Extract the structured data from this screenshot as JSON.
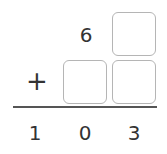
{
  "problem": {
    "operator": "+",
    "top_row": {
      "tens": "6",
      "ones_box": ""
    },
    "second_row": {
      "tens_box": "",
      "ones_box": ""
    },
    "result": {
      "hundreds": "1",
      "tens": "0",
      "ones": "3"
    }
  },
  "colors": {
    "box_border": "#b5b5b5",
    "text": "#333333",
    "rule": "#555555"
  }
}
